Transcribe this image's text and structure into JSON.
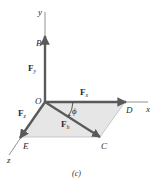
{
  "figure": {
    "caption": "(c)",
    "colors": {
      "arrow": "#5a5a5a",
      "axis": "#777777",
      "plane_fill": "#e6e6e6",
      "plane_edge": "#bdbdbd",
      "text": "#2a2a2a"
    },
    "axes": {
      "y": "y",
      "x": "x",
      "z": "z"
    },
    "points": {
      "origin": "O",
      "B": "B",
      "C": "C",
      "D": "D",
      "E": "E"
    },
    "vectors": {
      "Fy": {
        "main": "F",
        "sub": "y"
      },
      "Fx": {
        "main": "F",
        "sub": "x"
      },
      "Fz": {
        "main": "F",
        "sub": "z"
      },
      "Fh": {
        "main": "F",
        "sub": "h"
      }
    },
    "angle": "ϕ"
  }
}
